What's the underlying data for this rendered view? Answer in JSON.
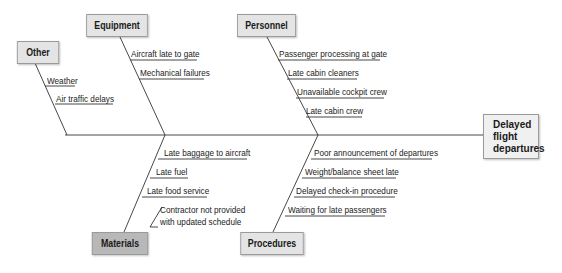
{
  "effect": {
    "label": "Delayed flight departures",
    "lines": [
      "Delayed",
      "flight",
      "departures"
    ]
  },
  "colors": {
    "line": "#333333",
    "box_light": "#e4e4e4",
    "box_dark": "#b8b8b8",
    "effect_box": "#f0f0f0"
  },
  "categories": {
    "other": {
      "label": "Other",
      "causes": [
        "Weather",
        "Air traffic delays"
      ]
    },
    "equipment": {
      "label": "Equipment",
      "causes": [
        "Aircraft late to gate",
        "Mechanical failures"
      ]
    },
    "personnel": {
      "label": "Personnel",
      "causes": [
        "Passenger processing at gate",
        "Late cabin cleaners",
        "Unavailable cockpit crew",
        "Late cabin crew"
      ]
    },
    "materials": {
      "label": "Materials",
      "causes": [
        "Late baggage to aircraft",
        "Late fuel",
        "Late food service"
      ],
      "sub_cause": {
        "line1": "Contractor not provided",
        "line2": "with updated schedule"
      }
    },
    "procedures": {
      "label": "Procedures",
      "causes": [
        "Poor announcement of departures",
        "Weight/balance sheet late",
        "Delayed check-in procedure",
        "Waiting for late passengers"
      ]
    }
  }
}
